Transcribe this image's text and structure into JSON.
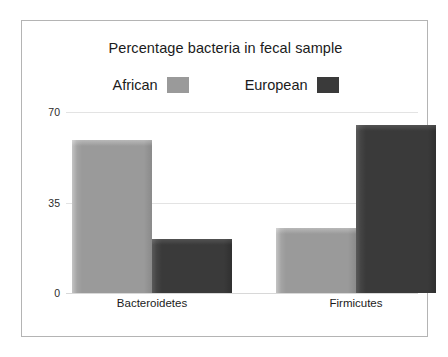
{
  "chart_data": {
    "type": "bar",
    "title": "Percentage bacteria in fecal sample",
    "xlabel": "",
    "ylabel": "",
    "categories": [
      "Bacteroidetes",
      "Firmicutes"
    ],
    "series": [
      {
        "name": "African",
        "color": "#9a9a9a",
        "values": [
          59,
          25
        ]
      },
      {
        "name": "European",
        "color": "#3a3a3a",
        "values": [
          21,
          65
        ]
      }
    ],
    "yticks": [
      "0",
      "35",
      "70"
    ],
    "ytick_values": [
      0,
      35,
      70
    ],
    "ylim": [
      0,
      70
    ],
    "grid": true,
    "legend_position": "top"
  },
  "axis": {
    "tick_70": "70",
    "tick_35": "35",
    "tick_0": "0"
  },
  "legend": {
    "entries": [
      {
        "label": "African",
        "swatch_color": "#9a9a9a"
      },
      {
        "label": "European",
        "swatch_color": "#3a3a3a"
      }
    ]
  },
  "categories": {
    "first": "Bacteroidetes",
    "second": "Firmicutes"
  },
  "colors": {
    "african": "#9a9a9a",
    "european": "#3a3a3a",
    "frame_border": "#b4b4b4",
    "gridline": "#e3e3e3",
    "background": "#ffffff",
    "text": "#1b1b1b"
  }
}
